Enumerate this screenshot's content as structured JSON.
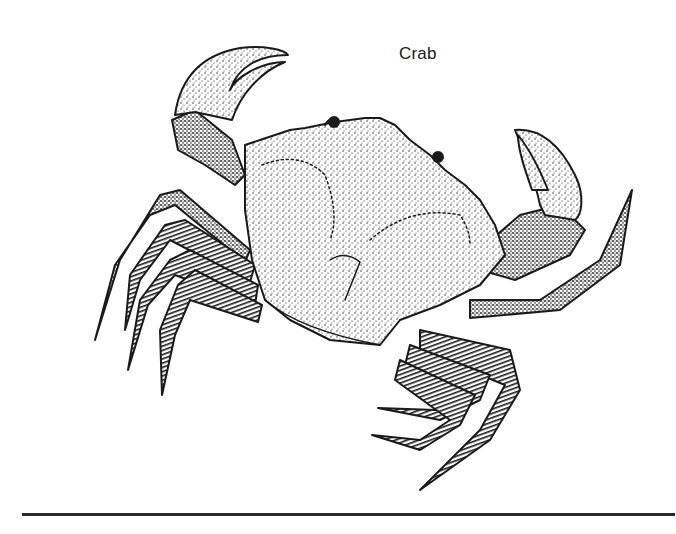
{
  "figure": {
    "label": "Crab",
    "style": "stipple-ink",
    "colors": {
      "ink": "#1a1a1a",
      "paper": "#ffffff",
      "rule": "#2a2a2a"
    }
  }
}
